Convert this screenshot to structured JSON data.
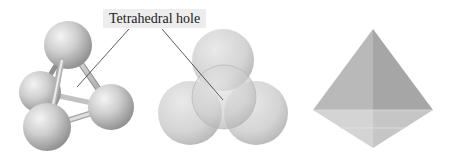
{
  "figure": {
    "label": "Tetrahedral hole",
    "panels": [
      {
        "name": "ball-and-stick-model",
        "description": "four spheres connected by rods surrounding a tetrahedral hole"
      },
      {
        "name": "space-filling-model",
        "description": "four overlapping spheres packed around a tetrahedral hole"
      },
      {
        "name": "tetrahedron-shape",
        "description": "shaded tetrahedron polyhedron"
      }
    ]
  },
  "colors": {
    "background": "#ffffff",
    "label_bg": "#ededed",
    "sphere_light": "#e6e6e6",
    "sphere_dark": "#8f8f8f",
    "leader_line": "#333333"
  }
}
